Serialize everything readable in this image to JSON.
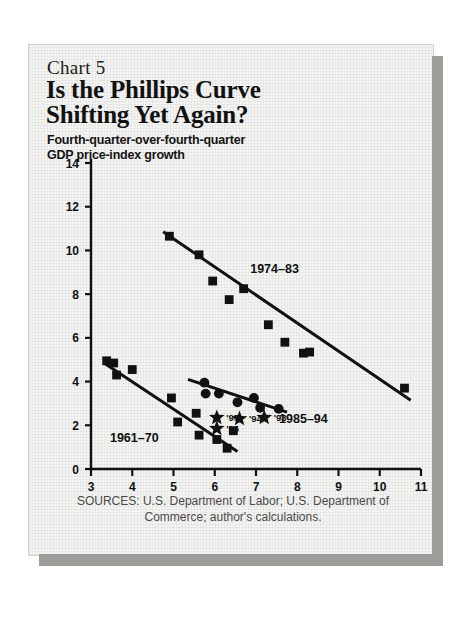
{
  "card": {
    "chart_number": "Chart 5",
    "title_line1": "Is the Phillips Curve",
    "title_line2": "Shifting Yet Again?",
    "subtitle_line1": "Fourth-quarter-over-fourth-quarter",
    "subtitle_line2": "GDP price-index growth",
    "sources_line1": "SOURCES: U.S. Department of Labor; U.S. Department",
    "sources_line2": "of Commerce; author's calculations."
  },
  "chart_data": {
    "type": "scatter",
    "title": "Is the Phillips Curve Shifting Yet Again?",
    "subtitle": "Fourth-quarter-over-fourth-quarter GDP price-index growth",
    "xlabel": "Unemployment rate (fourth quarter of prior year)",
    "ylabel": "",
    "xlim": [
      3,
      11
    ],
    "ylim": [
      0,
      14
    ],
    "xticks": [
      3,
      4,
      5,
      6,
      7,
      8,
      9,
      10,
      11
    ],
    "yticks": [
      0,
      2,
      4,
      6,
      8,
      10,
      12,
      14
    ],
    "grid": false,
    "legend_position": "inline-annotations",
    "series": [
      {
        "name": "1961-70",
        "label": "1961–70",
        "marker": "square",
        "label_x": 4.05,
        "label_y": 1.25,
        "points": [
          {
            "x": 3.38,
            "y": 4.95
          },
          {
            "x": 3.55,
            "y": 4.85
          },
          {
            "x": 3.62,
            "y": 4.3
          },
          {
            "x": 4.0,
            "y": 4.55
          },
          {
            "x": 4.95,
            "y": 3.25
          },
          {
            "x": 5.1,
            "y": 2.15
          },
          {
            "x": 5.55,
            "y": 2.55
          },
          {
            "x": 5.62,
            "y": 1.55
          },
          {
            "x": 6.05,
            "y": 1.35
          },
          {
            "x": 6.3,
            "y": 0.95
          },
          {
            "x": 6.45,
            "y": 1.75
          }
        ],
        "trend": {
          "x1": 3.35,
          "y1": 4.8,
          "x2": 6.55,
          "y2": 0.8
        }
      },
      {
        "name": "1974-83",
        "label": "1974–83",
        "marker": "square",
        "label_x": 7.45,
        "label_y": 8.95,
        "points": [
          {
            "x": 4.9,
            "y": 10.65
          },
          {
            "x": 5.62,
            "y": 9.8
          },
          {
            "x": 5.95,
            "y": 8.6
          },
          {
            "x": 6.35,
            "y": 7.75
          },
          {
            "x": 6.7,
            "y": 8.25
          },
          {
            "x": 7.3,
            "y": 6.6
          },
          {
            "x": 7.7,
            "y": 5.8
          },
          {
            "x": 8.15,
            "y": 5.3
          },
          {
            "x": 8.3,
            "y": 5.35
          },
          {
            "x": 10.6,
            "y": 3.7
          }
        ],
        "trend": {
          "x1": 4.75,
          "y1": 10.85,
          "x2": 10.75,
          "y2": 3.15
        }
      },
      {
        "name": "1985-94",
        "label": "1985–94",
        "marker": "circle",
        "label_x": 8.15,
        "label_y": 2.1,
        "points": [
          {
            "x": 5.75,
            "y": 3.95
          },
          {
            "x": 5.78,
            "y": 3.45
          },
          {
            "x": 6.1,
            "y": 3.45
          },
          {
            "x": 6.55,
            "y": 3.05
          },
          {
            "x": 6.95,
            "y": 3.25
          },
          {
            "x": 7.1,
            "y": 2.8
          },
          {
            "x": 7.55,
            "y": 2.75
          }
        ],
        "trend": {
          "x1": 5.35,
          "y1": 4.1,
          "x2": 7.75,
          "y2": 2.6
        }
      },
      {
        "name": "recent-years",
        "label": "",
        "marker": "star",
        "points": [
          {
            "x": 6.05,
            "y": 2.35,
            "label": "'95"
          },
          {
            "x": 6.05,
            "y": 1.85,
            "label": "'96"
          },
          {
            "x": 6.6,
            "y": 2.3,
            "label": "'94"
          },
          {
            "x": 7.2,
            "y": 2.35,
            "label": "'93"
          }
        ]
      }
    ]
  }
}
